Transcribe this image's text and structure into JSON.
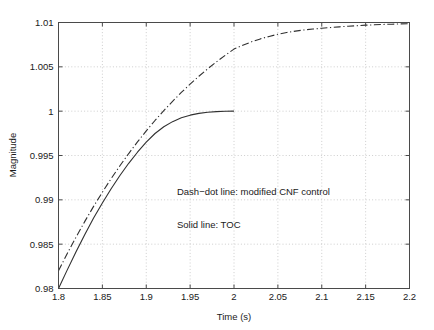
{
  "chart_data": {
    "type": "line",
    "title": "",
    "xlabel": "Time (s)",
    "ylabel": "Magnitude",
    "xlim": [
      1.8,
      2.2
    ],
    "ylim": [
      0.98,
      1.01
    ],
    "grid": true,
    "legend_position": "inside-annotations",
    "xticks": [
      "1.8",
      "1.85",
      "1.9",
      "1.95",
      "2",
      "2.05",
      "2.1",
      "2.15",
      "2.2"
    ],
    "xtick_values": [
      1.8,
      1.85,
      1.9,
      1.95,
      2.0,
      2.05,
      2.1,
      2.15,
      2.2
    ],
    "yticks": [
      "0.98",
      "0.985",
      "0.99",
      "0.995",
      "1",
      "1.005",
      "1.01"
    ],
    "ytick_values": [
      0.98,
      0.985,
      0.99,
      0.995,
      1.0,
      1.005,
      1.01
    ],
    "annotations": [
      {
        "text": "Dash−dot line: modified CNF control",
        "x": 1.935,
        "y": 0.9905
      },
      {
        "text": "Solid line: TOC",
        "x": 1.935,
        "y": 0.9868
      }
    ],
    "series": [
      {
        "name": "modified CNF control",
        "style": "dash-dot",
        "color": "#303030",
        "x": [
          1.8,
          1.81,
          1.82,
          1.83,
          1.84,
          1.85,
          1.86,
          1.87,
          1.88,
          1.89,
          1.9,
          1.91,
          1.92,
          1.93,
          1.94,
          1.95,
          1.96,
          1.97,
          1.98,
          1.99,
          2.0,
          2.01,
          2.02,
          2.03,
          2.04,
          2.05,
          2.06,
          2.07,
          2.08,
          2.09,
          2.1,
          2.11,
          2.12,
          2.13,
          2.14,
          2.15,
          2.16,
          2.17,
          2.18,
          2.19,
          2.2
        ],
        "y": [
          0.982,
          0.98395,
          0.9858,
          0.98757,
          0.98926,
          0.99086,
          0.99239,
          0.99384,
          0.99522,
          0.99653,
          0.99777,
          0.99895,
          1.00006,
          1.00111,
          1.00211,
          1.00305,
          1.00394,
          1.00477,
          1.00556,
          1.0063,
          1.007,
          1.00744,
          1.00782,
          1.00815,
          1.00843,
          1.00867,
          1.00887,
          1.00903,
          1.00916,
          1.00926,
          1.00935,
          1.00943,
          1.00951,
          1.00958,
          1.00964,
          1.0097,
          1.00974,
          1.00978,
          1.00981,
          1.00984,
          1.00986
        ]
      },
      {
        "name": "TOC",
        "style": "solid",
        "color": "#303030",
        "x": [
          1.8,
          1.81,
          1.82,
          1.83,
          1.84,
          1.85,
          1.86,
          1.87,
          1.88,
          1.89,
          1.9,
          1.91,
          1.92,
          1.93,
          1.94,
          1.95,
          1.96,
          1.97,
          1.98,
          1.99,
          2.0
        ],
        "y": [
          0.98,
          0.9821,
          0.98415,
          0.9861,
          0.98795,
          0.98965,
          0.99125,
          0.99275,
          0.99412,
          0.99537,
          0.9965,
          0.99748,
          0.99824,
          0.99882,
          0.99925,
          0.99955,
          0.99975,
          0.99988,
          0.99995,
          0.99999,
          1.0
        ]
      }
    ]
  }
}
